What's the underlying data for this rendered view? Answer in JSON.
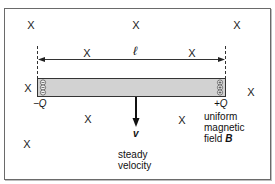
{
  "diagram": {
    "field_symbol": "X",
    "field_markers": [
      {
        "x": 31,
        "y": 25
      },
      {
        "x": 136,
        "y": 25
      },
      {
        "x": 237,
        "y": 25
      },
      {
        "x": 87,
        "y": 53
      },
      {
        "x": 191,
        "y": 53
      },
      {
        "x": 28,
        "y": 87
      },
      {
        "x": 251,
        "y": 92
      },
      {
        "x": 87,
        "y": 120
      },
      {
        "x": 182,
        "y": 120
      },
      {
        "x": 27,
        "y": 143
      }
    ],
    "rod": {
      "left_charge": "−Q",
      "right_charge": "+Q",
      "fill_color": "#d2d2d2",
      "border_color": "#333333"
    },
    "length_label": "ℓ",
    "velocity": {
      "symbol": "v",
      "caption_line1": "steady",
      "caption_line2": "velocity"
    },
    "field_caption": {
      "line1": "uniform",
      "line2": "magnetic",
      "line3_text": "field ",
      "line3_symbol": "B"
    }
  }
}
